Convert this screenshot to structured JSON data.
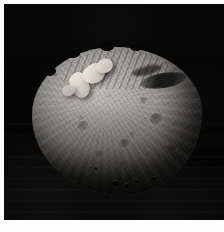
{
  "image": {
    "subject": "asteroid",
    "subject_name": "Vesta",
    "scene": "grayscale spacecraft photograph of a large irregular asteroid against black space",
    "background_color": "#050505",
    "border_color": "#ffffff",
    "body_color": "#a9a5a0",
    "highlight_color": "#f0ece4",
    "shadow_color": "#46443f",
    "alt_text": "Grayscale image of the asteroid Vesta, a roughly spherical cratered body, lit from the upper left with bright ridges near the upper-left limb and a dark elongated trough on the upper right, shown against a black star-free background."
  },
  "frame": {
    "width_px": 224,
    "height_px": 232,
    "plate_left_px": 4,
    "plate_top_px": 4,
    "plate_width_px": 220,
    "plate_height_px": 216
  },
  "features": [
    {
      "name": "bright-scarp-cluster",
      "label": "Bright ridge and scarp cluster",
      "region": "upper-left"
    },
    {
      "name": "dark-trough",
      "label": "Dark elongated shadowed trough",
      "region": "upper-right"
    },
    {
      "name": "ridged-terrain",
      "label": "Striated ridged terrain",
      "region": "north limb"
    },
    {
      "name": "crater-field",
      "label": "Cratered regolith plains",
      "region": "central disc"
    },
    {
      "name": "shadowed-limb",
      "label": "Shadowed lower limb (terminator)",
      "region": "bottom"
    }
  ]
}
